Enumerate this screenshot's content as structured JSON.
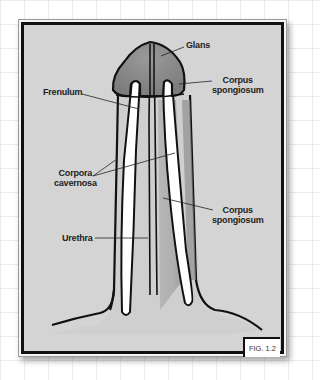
{
  "figure": {
    "caption": "FIG. 1.2",
    "colors": {
      "background": "#d4d4d4",
      "glans": "#8a8a8a",
      "spongiosum": "#a8a8a8",
      "cavernosa": "#ffffff",
      "outline": "#111111"
    }
  },
  "labels": {
    "glans": "Glans",
    "corpus_spongiosum_top_line1": "Corpus",
    "corpus_spongiosum_top_line2": "spongiosum",
    "frenulum": "Frenulum",
    "corpora_cavernosa_line1": "Corpora",
    "corpora_cavernosa_line2": "cavernosa",
    "corpus_spongiosum_mid_line1": "Corpus",
    "corpus_spongiosum_mid_line2": "spongiosum",
    "urethra": "Urethra"
  }
}
